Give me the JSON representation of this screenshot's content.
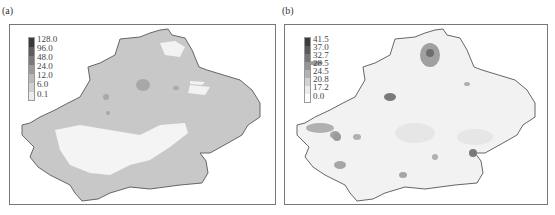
{
  "panels": [
    {
      "label": "(a)",
      "legend": {
        "values": [
          "128.0",
          "96.0",
          "48.0",
          "24.0",
          "12.0",
          "6.0",
          "0.1"
        ],
        "colors": [
          "#3a3a3a",
          "#5e5e5e",
          "#7a7a7a",
          "#9a9a9a",
          "#b9b9b9",
          "#cfcfcf",
          "#ececec"
        ]
      },
      "base_fill": "#c8c8c8",
      "low_fill": "#f4f4f4"
    },
    {
      "label": "(b)",
      "legend": {
        "values": [
          "41.5",
          "37.0",
          "32.7",
          "28.5",
          "24.5",
          "20.8",
          "17.2",
          "0.0"
        ],
        "colors": [
          "#3c3c3c",
          "#5a5a5a",
          "#777777",
          "#949494",
          "#b2b2b2",
          "#d2d2d2",
          "#ececec",
          "#ffffff"
        ]
      },
      "base_fill": "#f2f2f2",
      "low_fill": "#fbfbfb"
    }
  ]
}
